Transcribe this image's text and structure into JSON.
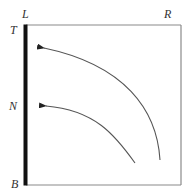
{
  "diagram": {
    "labels": {
      "top_left_corner": "L",
      "top_right_corner": "R",
      "left_top": "T",
      "left_middle": "N",
      "left_bottom": "B"
    },
    "frame": {
      "left_edge": "thick black bar",
      "other_edges": "thin gray lines"
    },
    "arrows": [
      {
        "from": "lower right (near R side)",
        "to": "upper left near T",
        "style": "curved, arrowhead at left end"
      },
      {
        "from": "bottom middle",
        "to": "left near N",
        "style": "curved, arrowhead at left end"
      }
    ],
    "colors": {
      "thick_edge": "#111111",
      "thin_edge": "#8a8a8a",
      "curve": "#555555",
      "label": "#333333"
    }
  }
}
